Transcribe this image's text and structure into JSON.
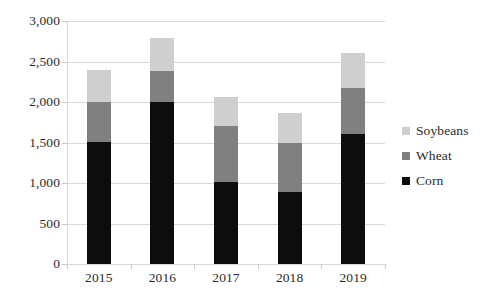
{
  "chart_data": {
    "type": "bar",
    "subtype": "stacked-bar",
    "title": "",
    "xlabel": "",
    "ylabel": "",
    "categories": [
      "2015",
      "2016",
      "2017",
      "2018",
      "2019"
    ],
    "series": [
      {
        "name": "Corn",
        "color": "#0d0d0d",
        "values": [
          1510,
          2000,
          1010,
          890,
          1600
        ]
      },
      {
        "name": "Wheat",
        "color": "#808080",
        "values": [
          490,
          380,
          700,
          610,
          570
        ]
      },
      {
        "name": "Soybeans",
        "color": "#cfcfcf",
        "values": [
          400,
          410,
          350,
          360,
          430
        ]
      }
    ],
    "totals": [
      2400,
      2790,
      2060,
      1860,
      2600
    ],
    "ylim": [
      0,
      3000
    ],
    "ytick_values": [
      0,
      500,
      1000,
      1500,
      2000,
      2500,
      3000
    ],
    "ytick_labels": [
      "0",
      "500",
      "1,000",
      "1,500",
      "2,000",
      "2,500",
      "3,000"
    ],
    "grid": true,
    "legend_position": "right",
    "legend": [
      {
        "label": "Soybeans",
        "color": "#cfcfcf"
      },
      {
        "label": "Wheat",
        "color": "#808080"
      },
      {
        "label": "Corn",
        "color": "#0d0d0d"
      }
    ],
    "stack_order_bottom_to_top": [
      "Corn",
      "Wheat",
      "Soybeans"
    ],
    "background_color": "#ffffff",
    "gridline_color": "#d9d9d9",
    "text_color": "#2b2b2b"
  }
}
